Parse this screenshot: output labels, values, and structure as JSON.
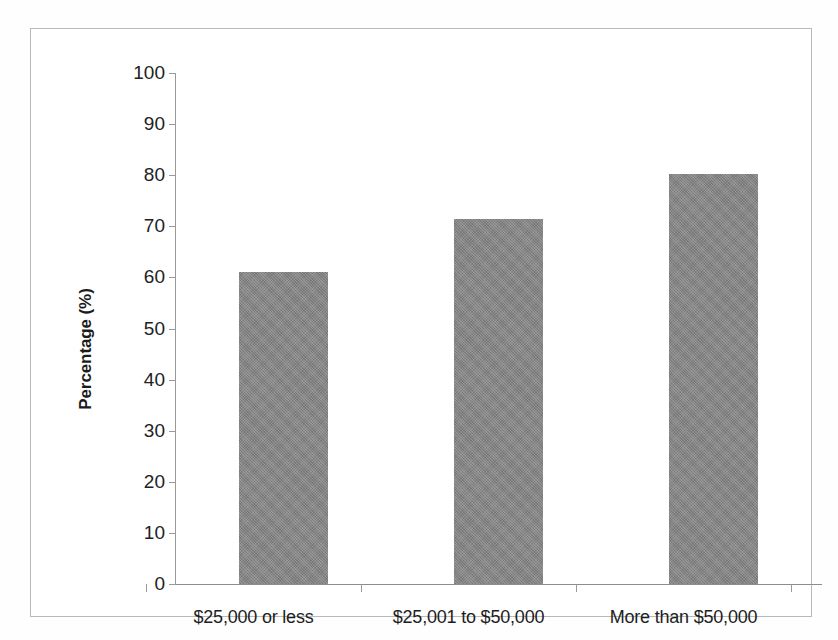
{
  "chart_data": {
    "type": "bar",
    "title": "",
    "subtitle": "",
    "xlabel": "",
    "ylabel": "Percentage (%)",
    "categories": [
      "$25,000 or less",
      "$25,001 to $50,000",
      "More than $50,000"
    ],
    "values": [
      61.1,
      71.4,
      80.2
    ],
    "ylim": [
      0,
      100
    ],
    "ytick_step": 10,
    "yticks": [
      "100",
      "90",
      "80",
      "70",
      "60",
      "50",
      "40",
      "30",
      "20",
      "10",
      "0"
    ],
    "grid": false,
    "legend": null,
    "legend_position": "none",
    "bar_color": "#848484",
    "axis_color": "#9a9a9a",
    "frame_color": "#b9b9b9",
    "text_color": "#1d1d1d",
    "annotations": []
  }
}
